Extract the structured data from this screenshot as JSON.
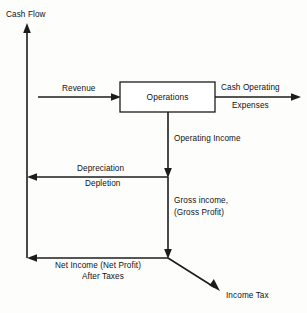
{
  "diagram": {
    "type": "cash-flow-diagram",
    "title_axis": "Cash Flow",
    "nodes": {
      "operations_box": "Operations"
    },
    "labels": {
      "cash_flow_axis": "Cash Flow",
      "revenue": "Revenue",
      "cash_operating": "Cash Operating",
      "expenses": "Expenses",
      "operating_income": "Operating Income",
      "depreciation": "Depreciation",
      "depletion": "Depletion",
      "gross_income_line1": "Gross income,",
      "gross_income_line2": "(Gross Profit)",
      "net_income_line1": "Net Income (Net Profit)",
      "net_income_line2": "After Taxes",
      "income_tax": "Income Tax"
    },
    "colors": {
      "stroke": "#1c1c1c",
      "background": "#fdfdfc",
      "text": "#111111",
      "box_fill": "#ffffff"
    }
  }
}
